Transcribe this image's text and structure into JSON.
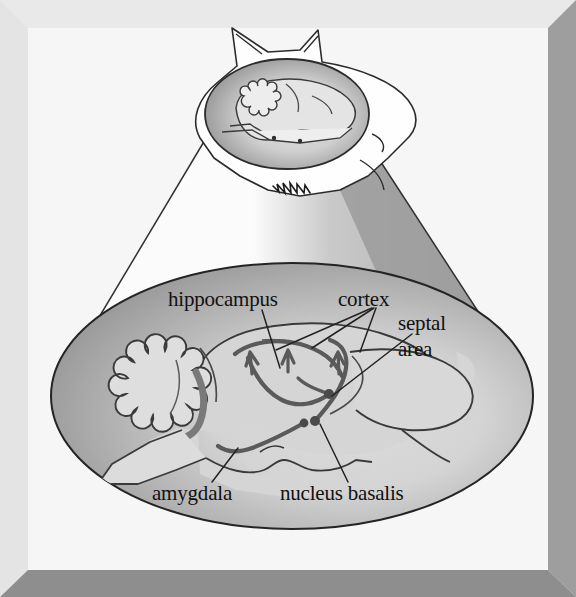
{
  "figure": {
    "frame": {
      "highlight_color": "#e8e8e8",
      "shadow_color": "#8e8e8e",
      "background_color": "#f0f0f0",
      "inner_background_color": "#f7f7f7"
    },
    "magnifier": {
      "cone_light_color": "#fbfbfb",
      "cone_shadow_color": "#9c9c9c",
      "outline_color": "#2a2a2a"
    },
    "inset": {
      "name": "cat head with brain shown in situ",
      "head_fill": "#fefefe",
      "brain_ellipse_dark_fill": "#8c8c8c",
      "brain_fill": "#dcdcdc"
    },
    "magnified_view": {
      "name": "magnified sagittal brain section",
      "ellipse_fill_dark": "#9a9a9a",
      "ellipse_fill_light": "#d8d8d8",
      "brain_fill": "#d4d4d4",
      "pathway_color": "#5a5a5a"
    }
  },
  "labels": [
    {
      "id": "hippocampus",
      "text": "hippocampus",
      "x": 172,
      "y": 300,
      "anchor": "start",
      "lines": [
        "hippocampus"
      ]
    },
    {
      "id": "cortex",
      "text": "cortex",
      "x": 340,
      "y": 300,
      "anchor": "start",
      "lines": [
        "cortex"
      ]
    },
    {
      "id": "septal-area",
      "text": "septal area",
      "x": 400,
      "y": 327,
      "anchor": "start",
      "lines": [
        "septal",
        "area"
      ]
    },
    {
      "id": "amygdala",
      "text": "amygdala",
      "x": 155,
      "y": 495,
      "anchor": "start",
      "lines": [
        "amygdala"
      ]
    },
    {
      "id": "nucleus-basalis",
      "text": "nucleus basalis",
      "x": 283,
      "y": 495,
      "anchor": "start",
      "lines": [
        "nucleus basalis"
      ]
    }
  ],
  "structures": [
    {
      "id": "cerebellum",
      "name": "cerebellum"
    },
    {
      "id": "brainstem",
      "name": "brain stem"
    },
    {
      "id": "olfactory-bulb",
      "name": "olfactory bulb"
    },
    {
      "id": "cortex-surface",
      "name": "cerebral cortex surface"
    }
  ],
  "pathway_nodes": [
    {
      "id": "septal-node",
      "cx": 329,
      "cy": 394
    },
    {
      "id": "nucleus-basalis-node",
      "cx": 315,
      "cy": 421
    },
    {
      "id": "amygdala-node",
      "cx": 304,
      "cy": 423
    }
  ]
}
